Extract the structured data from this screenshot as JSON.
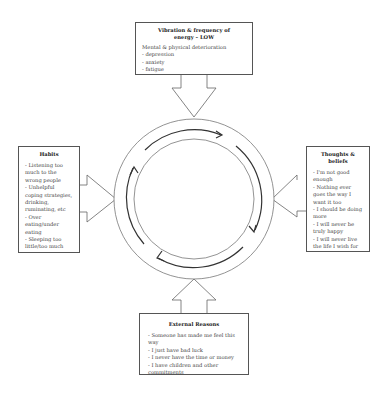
{
  "diagram": {
    "top_box": {
      "title": "Vibration & frequency of energy – LOW",
      "intro": "Mental & physical deterioration",
      "items": [
        "- depression",
        "- anxiety",
        "- fatigue"
      ]
    },
    "left_box": {
      "title": "Habits",
      "items": [
        "- Listening too much to the wrong people",
        "- Unhelpful coping strategies, drinking, ruminating, etc",
        "- Over eating/under eating",
        "- Sleeping too little/too much"
      ]
    },
    "right_box": {
      "title": "Thoughts & beliefs",
      "items": [
        "- I'm not good enough",
        "- Nothing ever goes the way I want it too",
        "- I should be doing more",
        "- I will never be truly happy",
        "- I will never live the life I wish for"
      ]
    },
    "bottom_box": {
      "title": "External Reasons",
      "items": [
        "- Someone has made me feel this way",
        "- I just have bad luck",
        "- I never have the time or money",
        "- I have children and other commitments"
      ]
    },
    "cycle": {
      "arrows": 4,
      "direction": "clockwise"
    }
  }
}
